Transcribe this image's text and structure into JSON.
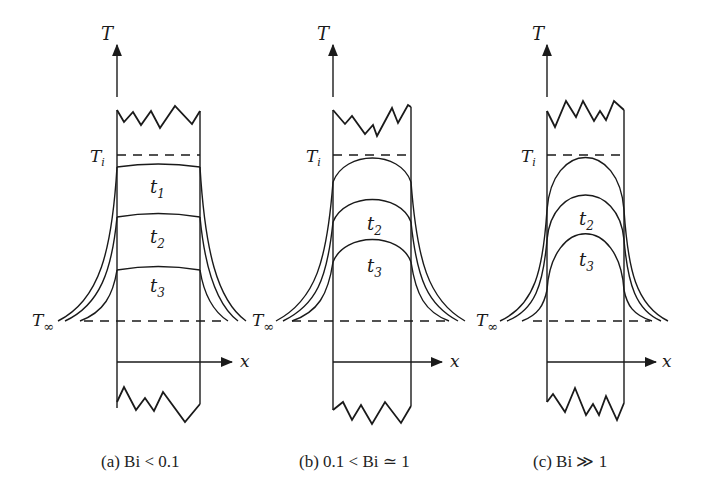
{
  "figure": {
    "axis_labels": {
      "temperature": "T",
      "position": "x"
    },
    "reference_levels": {
      "initial": "Ti",
      "initial_base": "T",
      "initial_sub": "i",
      "ambient_base": "T",
      "ambient_sub": "∞"
    },
    "panels": [
      {
        "id": "a",
        "caption": "(a) Bi < 0.1",
        "time_labels": [
          {
            "base": "t",
            "sub": "1"
          },
          {
            "base": "t",
            "sub": "2"
          },
          {
            "base": "t",
            "sub": "3"
          }
        ],
        "profile_shape": "nearly uniform (flat)"
      },
      {
        "id": "b",
        "caption": "(b) 0.1 < Bi ≃ 1",
        "time_labels": [
          {
            "base": "t",
            "sub": "2"
          },
          {
            "base": "t",
            "sub": "3"
          }
        ],
        "profile_shape": "moderately curved"
      },
      {
        "id": "c",
        "caption": "(c) Bi ≫ 1",
        "time_labels": [
          {
            "base": "t",
            "sub": "2"
          },
          {
            "base": "t",
            "sub": "3"
          }
        ],
        "profile_shape": "strongly curved"
      }
    ]
  }
}
